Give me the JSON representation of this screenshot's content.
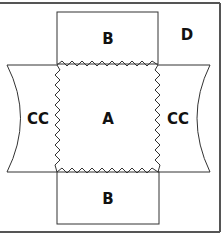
{
  "diagram": {
    "colors": {
      "line": "#333333",
      "frame": "#555555",
      "text": "#111111",
      "background": "#ffffff"
    },
    "labels": {
      "center": "A",
      "top": "B",
      "bottom": "B",
      "left": "CC",
      "right": "CC",
      "corner": "D"
    },
    "regions": [
      {
        "id": "A",
        "description": "central square with zigzag edges"
      },
      {
        "id": "B",
        "description": "rectangular flap above and below A"
      },
      {
        "id": "CC",
        "description": "concave-sided flaps left and right of A"
      },
      {
        "id": "D",
        "description": "outer surrounding area"
      }
    ]
  }
}
